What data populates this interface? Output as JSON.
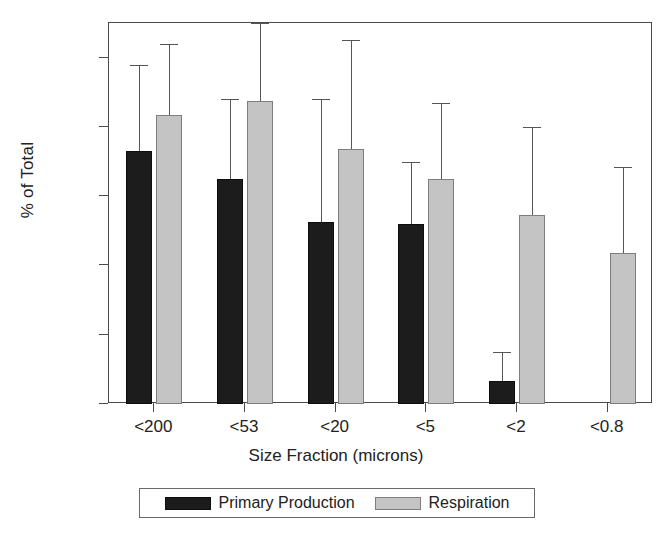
{
  "chart_data": {
    "type": "bar",
    "title": "",
    "xlabel": "Size Fraction (microns)",
    "ylabel": "% of Total",
    "categories": [
      "<200",
      "<53",
      "<20",
      "<5",
      "<2",
      "<0.8"
    ],
    "ylim": [
      0,
      110
    ],
    "yticks": [
      0,
      20,
      40,
      60,
      80,
      100
    ],
    "ytick_labels": [
      "0",
      "20",
      "40",
      "60",
      "80",
      "100"
    ],
    "grid": false,
    "legend_position": "bottom",
    "error_bars": "upper only",
    "series": [
      {
        "name": "Primary Production",
        "color": "#1c1c1c",
        "values": [
          73,
          65,
          52.5,
          52,
          6.5,
          null
        ],
        "errors_upper": [
          98,
          88,
          88,
          70,
          15,
          null
        ]
      },
      {
        "name": "Respiration",
        "color": "#c4c4c4",
        "values": [
          83.5,
          87.5,
          73.5,
          65,
          54.5,
          43.5
        ],
        "errors_upper": [
          104,
          110,
          105,
          87,
          80,
          68.5
        ]
      }
    ]
  },
  "legend": {
    "entries": [
      {
        "label": "Primary Production",
        "swatch": "dark"
      },
      {
        "label": "Respiration",
        "swatch": "light"
      }
    ]
  },
  "axes": {
    "y_title": "% of Total",
    "x_title": "Size Fraction (microns)",
    "y_tick_0": "0",
    "y_tick_1": "20",
    "y_tick_2": "40",
    "y_tick_3": "60",
    "y_tick_4": "80",
    "y_tick_5": "100",
    "x_tick_0": "<200",
    "x_tick_1": "<53",
    "x_tick_2": "<20",
    "x_tick_3": "<5",
    "x_tick_4": "<2",
    "x_tick_5": "<0.8"
  }
}
